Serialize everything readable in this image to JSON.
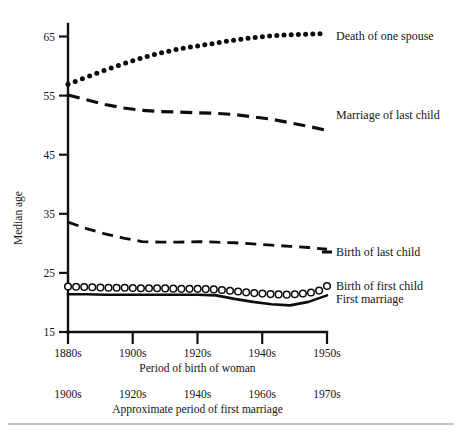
{
  "chart_data": {
    "type": "line",
    "title": "",
    "subtitle": "",
    "xlabel": "Period of birth of woman",
    "xlabel_secondary": "Approximate period of first marriage",
    "ylabel": "Median age",
    "ylim": [
      15,
      68
    ],
    "yticks": [
      15,
      25,
      35,
      45,
      55,
      65
    ],
    "ytick_labels": [
      "15",
      "25",
      "35",
      "45",
      "55",
      "65"
    ],
    "xticks": [
      1880,
      1900,
      1920,
      1940,
      1950
    ],
    "xtick_labels": [
      "1880s",
      "1900s",
      "1920s",
      "1940s",
      "1950s"
    ],
    "xtick_labels_secondary": [
      "1900s",
      "1920s",
      "1940s",
      "1960s",
      "1970s"
    ],
    "grid": false,
    "legend_position": "right-inline",
    "x": [
      1880,
      1885,
      1890,
      1895,
      1900,
      1905,
      1910,
      1915,
      1920,
      1925,
      1930,
      1935,
      1940,
      1945,
      1950
    ],
    "series": [
      {
        "name": "Death of one spouse",
        "style": "dotted-markers",
        "values": [
          56.9,
          58.1,
          59.3,
          60.4,
          61.4,
          62.2,
          62.9,
          63.4,
          63.9,
          64.4,
          64.8,
          65.1,
          65.3,
          65.4,
          65.5
        ],
        "label": "Death of one spouse",
        "label_y": 65.8
      },
      {
        "name": "Marriage of last child",
        "style": "dashed-long",
        "values": [
          55.1,
          54.3,
          53.5,
          52.9,
          52.5,
          52.3,
          52.2,
          52.1,
          52.0,
          51.8,
          51.4,
          51.0,
          50.4,
          49.8,
          49.1
        ],
        "label": "Marriage of last child",
        "label_y": 53.0
      },
      {
        "name": "Birth of last child",
        "style": "dashed-mid",
        "values": [
          33.6,
          32.5,
          31.6,
          30.9,
          30.3,
          30.2,
          30.2,
          30.3,
          30.2,
          30.1,
          29.9,
          29.7,
          29.5,
          29.3,
          29.0
        ],
        "label": "Birth of last child",
        "label_y": 29.9
      },
      {
        "name": "Birth of first child",
        "style": "open-circle-markers",
        "values": [
          22.7,
          22.6,
          22.5,
          22.5,
          22.4,
          22.4,
          22.3,
          22.3,
          22.2,
          21.9,
          21.6,
          21.4,
          21.3,
          21.6,
          22.3
        ],
        "label": "Birth of first child",
        "label_y": 23.4
      },
      {
        "name": "First marriage",
        "style": "solid",
        "values": [
          21.4,
          21.4,
          21.3,
          21.3,
          21.3,
          21.3,
          21.3,
          21.3,
          21.2,
          20.6,
          20.1,
          19.7,
          19.5,
          20.1,
          21.2
        ],
        "label": "First marriage",
        "label_y": 21.4
      }
    ]
  },
  "axes": {
    "y_title": "Median age",
    "x_title_primary": "Period of birth of woman",
    "x_title_secondary": "Approximate period of first marriage"
  },
  "labels": {
    "y_ticks": [
      "65",
      "55",
      "45",
      "35",
      "25",
      "15"
    ],
    "x_ticks_primary": [
      "1880s",
      "1900s",
      "1920s",
      "1940s",
      "1950s"
    ],
    "x_ticks_secondary": [
      "1900s",
      "1920s",
      "1940s",
      "1960s",
      "1970s"
    ],
    "series_labels": [
      "Death of one spouse",
      "Marriage of last child",
      "Birth of last child",
      "Birth of first child",
      "First marriage"
    ]
  },
  "colors": {
    "ink": "#0d0d0d",
    "axis": "#121212",
    "background": "#ffffff",
    "rule": "#8a8a8a"
  }
}
